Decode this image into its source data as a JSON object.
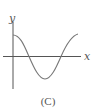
{
  "figure": {
    "caption": "(C)",
    "x_label": "x",
    "y_label": "y",
    "axis_color": "#555555",
    "curve_color": "#777777",
    "curve": "cosine-like: starts at positive max on y-axis, crosses x-axis, reaches minimum, crosses back up"
  }
}
